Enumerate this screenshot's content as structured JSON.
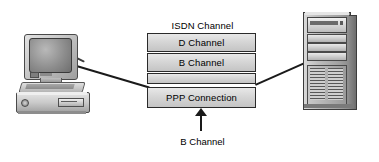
{
  "diagram": {
    "title": "ISDN Channel",
    "bottom_caption": "B Channel",
    "channels": [
      {
        "id": "d-channel",
        "label": "D Channel"
      },
      {
        "id": "b-channel",
        "label": "B Channel"
      },
      {
        "id": "unlabeled-band",
        "label": ""
      },
      {
        "id": "ppp-connection",
        "label": "PPP Connection"
      }
    ],
    "nodes": {
      "left_workstation": "workstation",
      "right_server": "tower-server"
    },
    "colors": {
      "box_fill_light": "#e8e8e8",
      "box_fill_dark": "#c4c4c4",
      "box_border": "#2a2a2a",
      "line": "#1a1a1a",
      "text": "#000000",
      "background": "#ffffff"
    }
  }
}
